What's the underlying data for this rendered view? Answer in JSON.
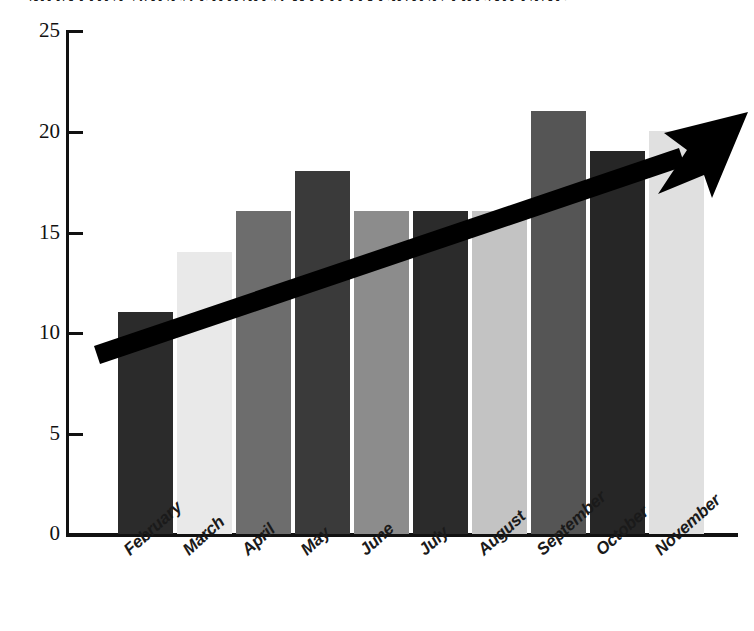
{
  "chart": {
    "title": "MONTHLY SALES FIGURES WITH OVERALL TREND LINE",
    "y_axis": {
      "ticks": [
        "0",
        "5",
        "10",
        "15",
        "20",
        "25"
      ]
    }
  },
  "chart_data": {
    "type": "bar",
    "title": "MONTHLY SALES FIGURES WITH OVERALL TREND LINE",
    "xlabel": "",
    "ylabel": "",
    "ylim": [
      0,
      25
    ],
    "ytick_values": [
      0,
      5,
      10,
      15,
      20,
      25
    ],
    "grid": false,
    "legend": "none",
    "categories": [
      "February",
      "March",
      "April",
      "May",
      "June",
      "July",
      "August",
      "September",
      "October",
      "November"
    ],
    "values": [
      11,
      14,
      16,
      18,
      16,
      16,
      16,
      21,
      19,
      20
    ],
    "bar_colors": [
      "#2b2b2b",
      "#e9e9e9",
      "#6d6d6d",
      "#3a3a3a",
      "#8c8c8c",
      "#2b2b2b",
      "#c3c3c3",
      "#555555",
      "#262626",
      "#e0e0e0"
    ],
    "annotations": [
      {
        "type": "trend-arrow",
        "label": "overall upward trend line",
        "color": "#000000",
        "start_value": 9.6,
        "end_value": 20.5,
        "direction": "up-right"
      }
    ]
  }
}
